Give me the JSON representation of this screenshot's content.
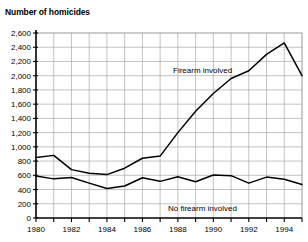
{
  "chart_data": {
    "type": "line",
    "title": "Number of homicides",
    "xlabel": "",
    "ylabel": "",
    "ylim": [
      0,
      2600
    ],
    "xlim": [
      1980,
      1995
    ],
    "grid": true,
    "legend_position": "inline-annotations",
    "y_ticks": [
      0,
      200,
      400,
      600,
      800,
      1000,
      1200,
      1400,
      1600,
      1800,
      2000,
      2200,
      2400,
      2600
    ],
    "y_tick_labels": [
      "0",
      "200",
      "400",
      "600",
      "800",
      "1,000",
      "1,200",
      "1,400",
      "1,600",
      "1,800",
      "2,000",
      "2,200",
      "2,400",
      "2,600"
    ],
    "x": [
      1980,
      1981,
      1982,
      1983,
      1984,
      1985,
      1986,
      1987,
      1988,
      1989,
      1990,
      1991,
      1992,
      1993,
      1994,
      1995
    ],
    "x_ticks": [
      1980,
      1982,
      1984,
      1986,
      1988,
      1990,
      1992,
      1994
    ],
    "x_tick_labels": [
      "1980",
      "1982",
      "1984",
      "1986",
      "1988",
      "1990",
      "1992",
      "1994"
    ],
    "series": [
      {
        "name": "Firearm involved",
        "color": "#000000",
        "annotation": "Firearm involved",
        "values": [
          850,
          880,
          680,
          630,
          610,
          700,
          840,
          870,
          1200,
          1500,
          1750,
          1960,
          2070,
          2300,
          2460,
          2000
        ]
      },
      {
        "name": "No firearm involved",
        "color": "#000000",
        "annotation": "No firearm involved",
        "values": [
          590,
          550,
          570,
          490,
          415,
          450,
          565,
          515,
          580,
          510,
          605,
          595,
          490,
          575,
          545,
          470
        ]
      }
    ]
  },
  "annotations": {
    "firearm_label": "Firearm involved",
    "no_firearm_label": "No firearm involved"
  },
  "colors": {
    "line": "#000000",
    "grid": "#9a9a9a",
    "axis": "#000000",
    "background": "#ffffff"
  }
}
